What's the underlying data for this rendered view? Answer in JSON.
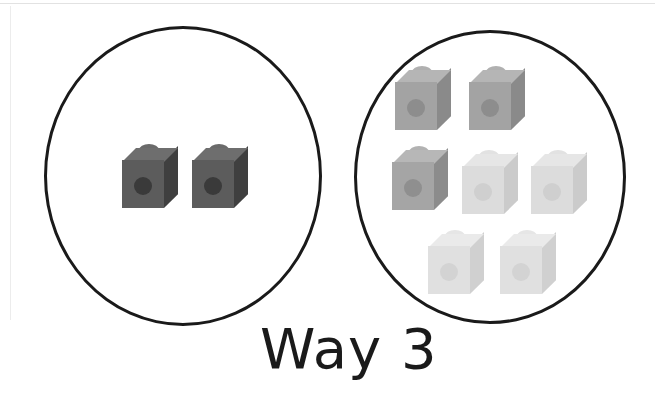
{
  "canvas": {
    "width": 655,
    "height": 402,
    "background": "#ffffff"
  },
  "caption": {
    "text": "Way 3",
    "x": 260,
    "y": 316,
    "font_size": 56,
    "color": "#1a1a1a"
  },
  "artifacts": {
    "top_rule_color": "#e2e2e2",
    "left_rule_color": "#ececec"
  },
  "groups": [
    {
      "name": "left-group",
      "label": "left-circle",
      "circle": {
        "x": 44,
        "y": 26,
        "width": 278,
        "height": 300,
        "stroke": "#1a1a1a",
        "stroke_width": 3
      },
      "cube_count": 2,
      "cubes": [
        {
          "name": "cube-l1",
          "x": 122,
          "y": 146,
          "front": "#5c5c5c",
          "side": "#3f3f3f",
          "top": "#6e6e6e",
          "hole": "#3a3a3a",
          "stud": "#6a6a6a",
          "stud_side": "#4a4a4a"
        },
        {
          "name": "cube-l2",
          "x": 192,
          "y": 146,
          "front": "#5c5c5c",
          "side": "#3f3f3f",
          "top": "#6e6e6e",
          "hole": "#3a3a3a",
          "stud": "#6a6a6a",
          "stud_side": "#4a4a4a"
        }
      ]
    },
    {
      "name": "right-group",
      "label": "right-circle",
      "circle": {
        "x": 354,
        "y": 30,
        "width": 272,
        "height": 294,
        "stroke": "#1a1a1a",
        "stroke_width": 3
      },
      "cube_count": 7,
      "cubes": [
        {
          "name": "cube-r1",
          "x": 395,
          "y": 68,
          "front": "#a3a3a3",
          "side": "#8a8a8a",
          "top": "#b5b5b5",
          "hole": "#8d8d8d",
          "stud": "#b0b0b0",
          "stud_side": "#999999"
        },
        {
          "name": "cube-r2",
          "x": 469,
          "y": 68,
          "front": "#a3a3a3",
          "side": "#8a8a8a",
          "top": "#b5b5b5",
          "hole": "#8d8d8d",
          "stud": "#b0b0b0",
          "stud_side": "#999999"
        },
        {
          "name": "cube-r3",
          "x": 392,
          "y": 148,
          "front": "#a5a5a5",
          "side": "#8c8c8c",
          "top": "#b7b7b7",
          "hole": "#8f8f8f",
          "stud": "#b2b2b2",
          "stud_side": "#9b9b9b"
        },
        {
          "name": "cube-r4",
          "x": 462,
          "y": 152,
          "front": "#dcdcdc",
          "side": "#cbcbcb",
          "top": "#e6e6e6",
          "hole": "#cfcfcf",
          "stud": "#e2e2e2",
          "stud_side": "#d4d4d4"
        },
        {
          "name": "cube-r5",
          "x": 531,
          "y": 152,
          "front": "#dcdcdc",
          "side": "#cbcbcb",
          "top": "#e6e6e6",
          "hole": "#cfcfcf",
          "stud": "#e2e2e2",
          "stud_side": "#d4d4d4"
        },
        {
          "name": "cube-r6",
          "x": 428,
          "y": 232,
          "front": "#e0e0e0",
          "side": "#d0d0d0",
          "top": "#eaeaea",
          "hole": "#d3d3d3",
          "stud": "#e6e6e6",
          "stud_side": "#d8d8d8"
        },
        {
          "name": "cube-r7",
          "x": 500,
          "y": 232,
          "front": "#e0e0e0",
          "side": "#d0d0d0",
          "top": "#eaeaea",
          "hole": "#d3d3d3",
          "stud": "#e6e6e6",
          "stud_side": "#d8d8d8"
        }
      ]
    }
  ]
}
